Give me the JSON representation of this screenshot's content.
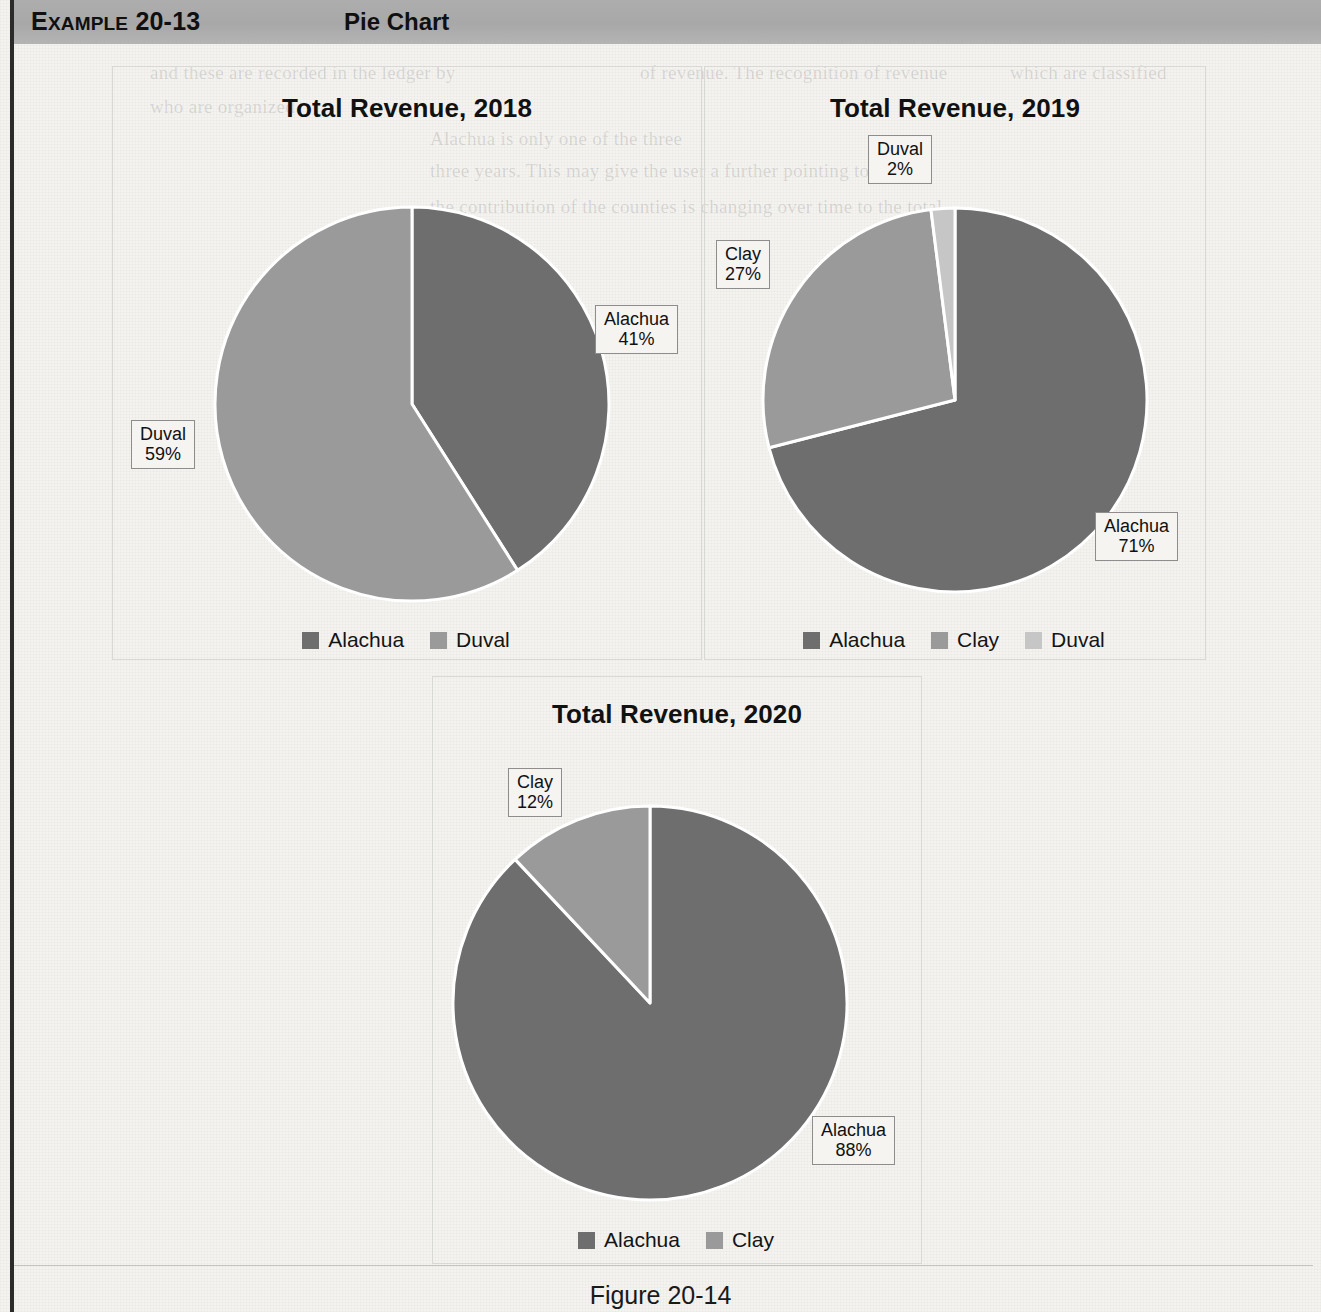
{
  "banner": {
    "example_label_small": "XAMPLE",
    "example_label_cap": "E",
    "example_number": "20-13",
    "title": "Pie Chart"
  },
  "caption": "Figure 20-14",
  "colors": {
    "alachua": "#6e6e6e",
    "clay": "#9a9a9a",
    "duval": "#9a9a9a",
    "duval_light": "#c6c6c6",
    "slice_divider": "#ffffff",
    "panel_border": "#d8d8d4",
    "callout_border": "#8d8d8d",
    "banner_gray": "#a8a8a8"
  },
  "ghost_text": [
    {
      "t": "and these are recorded in the ledger by",
      "x": 150,
      "y": 62
    },
    {
      "t": "of revenue. The recognition of revenue",
      "x": 640,
      "y": 62
    },
    {
      "t": "which are classified",
      "x": 1010,
      "y": 62
    },
    {
      "t": "who are organized",
      "x": 150,
      "y": 96
    },
    {
      "t": "Alachua is only one of the three",
      "x": 430,
      "y": 128
    },
    {
      "t": "three years. This may give the user a further pointing to",
      "x": 430,
      "y": 160
    },
    {
      "t": "the contribution of the counties is changing over time to the total",
      "x": 430,
      "y": 196
    }
  ],
  "charts": [
    {
      "id": "rev2018",
      "panel": {
        "left": 112,
        "top": 66,
        "width": 588,
        "height": 592
      },
      "title": "Total Revenue, 2018",
      "title_top": 26,
      "pie": {
        "cx": 412,
        "cy": 404,
        "r": 197,
        "start_deg": 0
      },
      "legend": {
        "left": 112,
        "top": 628,
        "width": 588
      },
      "callouts": [
        {
          "label": "Alachua",
          "value": "41%",
          "left": 595,
          "top": 305,
          "tail": "left"
        },
        {
          "label": "Duval",
          "value": "59%",
          "left": 131,
          "top": 420,
          "tail": "right"
        }
      ],
      "chart_data": {
        "type": "pie",
        "title": "Total Revenue, 2018",
        "labels": [
          "Alachua",
          "Duval"
        ],
        "values": [
          41,
          59
        ],
        "value_unit": "percent",
        "data_labels": [
          "Alachua 41%",
          "Duval 59%"
        ],
        "colors": [
          "#6e6e6e",
          "#9a9a9a"
        ],
        "legend": [
          "Alachua",
          "Duval"
        ],
        "legend_position": "bottom",
        "start_angle_deg": 0,
        "direction": "clockwise"
      }
    },
    {
      "id": "rev2019",
      "panel": {
        "left": 704,
        "top": 66,
        "width": 500,
        "height": 592
      },
      "title": "Total Revenue, 2019",
      "title_top": 26,
      "pie": {
        "cx": 955,
        "cy": 400,
        "r": 192,
        "start_deg": 0
      },
      "legend": {
        "left": 704,
        "top": 628,
        "width": 500
      },
      "callouts": [
        {
          "label": "Duval",
          "value": "2%",
          "left": 868,
          "top": 135,
          "tail": "down"
        },
        {
          "label": "Clay",
          "value": "27%",
          "left": 716,
          "top": 240,
          "tail": "right"
        },
        {
          "label": "Alachua",
          "value": "71%",
          "left": 1095,
          "top": 512,
          "tail": "left"
        }
      ],
      "chart_data": {
        "type": "pie",
        "title": "Total Revenue, 2019",
        "labels": [
          "Alachua",
          "Clay",
          "Duval"
        ],
        "values": [
          71,
          27,
          2
        ],
        "value_unit": "percent",
        "data_labels": [
          "Alachua 71%",
          "Clay 27%",
          "Duval 2%"
        ],
        "colors": [
          "#6e6e6e",
          "#9a9a9a",
          "#c6c6c6"
        ],
        "legend": [
          "Alachua",
          "Clay",
          "Duval"
        ],
        "legend_position": "bottom",
        "start_angle_deg": 0,
        "direction": "clockwise"
      }
    },
    {
      "id": "rev2020",
      "panel": {
        "left": 432,
        "top": 676,
        "width": 488,
        "height": 586
      },
      "title": "Total Revenue, 2020",
      "title_top": 22,
      "pie": {
        "cx": 650,
        "cy": 1003,
        "r": 197,
        "start_deg": 0
      },
      "legend": {
        "left": 432,
        "top": 1228,
        "width": 488
      },
      "callouts": [
        {
          "label": "Clay",
          "value": "12%",
          "left": 508,
          "top": 768,
          "tail": "down"
        },
        {
          "label": "Alachua",
          "value": "88%",
          "left": 812,
          "top": 1116,
          "tail": "left"
        }
      ],
      "chart_data": {
        "type": "pie",
        "title": "Total Revenue, 2020",
        "labels": [
          "Alachua",
          "Clay"
        ],
        "values": [
          88,
          12
        ],
        "value_unit": "percent",
        "data_labels": [
          "Alachua 88%",
          "Clay 12%"
        ],
        "colors": [
          "#6e6e6e",
          "#9a9a9a"
        ],
        "legend": [
          "Alachua",
          "Clay"
        ],
        "legend_position": "bottom",
        "start_angle_deg": 0,
        "direction": "clockwise"
      }
    }
  ],
  "chart_data": [
    {
      "type": "pie",
      "title": "Total Revenue, 2018",
      "labels": [
        "Alachua",
        "Duval"
      ],
      "values": [
        41,
        59
      ],
      "colors": [
        "#6e6e6e",
        "#9a9a9a"
      ],
      "legend": [
        "Alachua",
        "Duval"
      ],
      "legend_position": "bottom"
    },
    {
      "type": "pie",
      "title": "Total Revenue, 2019",
      "labels": [
        "Alachua",
        "Clay",
        "Duval"
      ],
      "values": [
        71,
        27,
        2
      ],
      "colors": [
        "#6e6e6e",
        "#9a9a9a",
        "#c6c6c6"
      ],
      "legend": [
        "Alachua",
        "Clay",
        "Duval"
      ],
      "legend_position": "bottom"
    },
    {
      "type": "pie",
      "title": "Total Revenue, 2020",
      "labels": [
        "Alachua",
        "Clay"
      ],
      "values": [
        88,
        12
      ],
      "colors": [
        "#6e6e6e",
        "#9a9a9a"
      ],
      "legend": [
        "Alachua",
        "Clay"
      ],
      "legend_position": "bottom"
    }
  ]
}
